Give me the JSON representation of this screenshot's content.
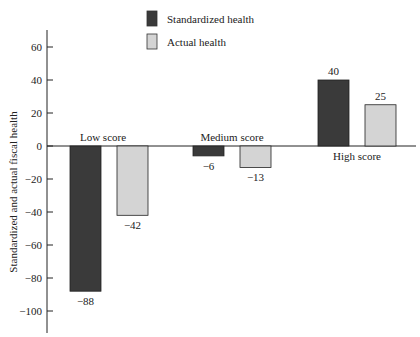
{
  "chart_data": {
    "type": "bar",
    "title": "",
    "xlabel": "",
    "ylabel": "Standardized and actual fiscal health",
    "categories": [
      "Low score",
      "Medium score",
      "High score"
    ],
    "series": [
      {
        "name": "Standardized health",
        "values": [
          -88,
          -6,
          40
        ],
        "color": "#3a3a3a"
      },
      {
        "name": "Actual health",
        "values": [
          -42,
          -13,
          25
        ],
        "color": "#d4d4d4"
      }
    ],
    "value_labels": {
      "Standardized health": [
        "−88",
        "−6",
        "40"
      ],
      "Actual health": [
        "−42",
        "−13",
        "25"
      ]
    },
    "yticks": [
      60,
      40,
      20,
      0,
      -20,
      -40,
      -60,
      -80,
      -100
    ],
    "ytick_labels": [
      "60",
      "40",
      "20",
      "0",
      "−20",
      "−40",
      "−60",
      "−80",
      "−100"
    ],
    "ylim": [
      -110,
      70
    ],
    "grid": false,
    "legend_position": "top-center"
  },
  "legend": {
    "items": [
      {
        "label": "Standardized health",
        "color": "#3a3a3a"
      },
      {
        "label": "Actual health",
        "color": "#d4d4d4"
      }
    ]
  }
}
